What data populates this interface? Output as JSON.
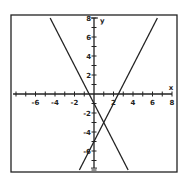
{
  "chart_data": {
    "type": "line",
    "title": "",
    "xlabel": "x",
    "ylabel": "y",
    "xlim": [
      -8,
      8
    ],
    "ylim": [
      -8,
      8
    ],
    "grid": false,
    "x_ticks": [
      -6,
      -4,
      -2,
      2,
      4,
      6,
      8
    ],
    "y_ticks": [
      8,
      6,
      4,
      2,
      -2,
      -4,
      -6
    ],
    "series": [
      {
        "name": "line-falling",
        "equation": "y = -2x - 1",
        "x": [
          -4.5,
          3.5
        ],
        "y": [
          8,
          -8
        ]
      },
      {
        "name": "line-rising",
        "equation": "y = 2x - 5",
        "x": [
          -1.5,
          6.5
        ],
        "y": [
          -8,
          8
        ]
      }
    ],
    "annotations": [
      {
        "label": "intersection",
        "x": 1,
        "y": -3
      }
    ]
  },
  "axes": {
    "x_label": "x",
    "y_label": "y"
  }
}
